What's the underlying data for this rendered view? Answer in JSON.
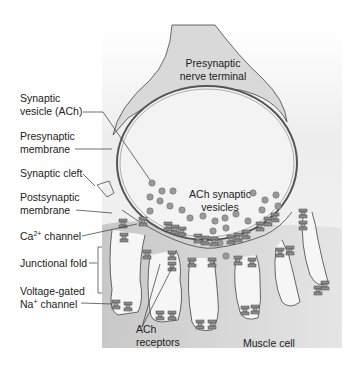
{
  "diagram": {
    "colors": {
      "background_panel": "#e6e6e6",
      "terminal_fill": "#d9d9d9",
      "cleft_fill": "#f2f2f2",
      "muscle_fill": "#bfbfbf",
      "vesicle_fill": "#9a9a9a",
      "channel_fill": "#8c8c8c",
      "outline": "#444444"
    },
    "inner_labels": {
      "presynaptic_terminal_line1": "Presynaptic",
      "presynaptic_terminal_line2": "nerve terminal",
      "ach_vesicles_line1": "ACh synaptic",
      "ach_vesicles_line2": "vesicles",
      "ach_receptors_line1": "ACh",
      "ach_receptors_line2": "receptors",
      "muscle_cell": "Muscle cell"
    },
    "left_labels": [
      {
        "id": "synaptic-vesicle",
        "line1": "Synaptic",
        "line2": "vesicle (ACh)"
      },
      {
        "id": "presynaptic-membrane",
        "line1": "Presynaptic",
        "line2": "membrane"
      },
      {
        "id": "synaptic-cleft",
        "line1": "Synaptic cleft",
        "line2": ""
      },
      {
        "id": "postsynaptic-membrane",
        "line1": "Postsynaptic",
        "line2": "membrane"
      },
      {
        "id": "ca-channel",
        "line1_pre": "Ca",
        "line1_sup": "2+",
        "line1_post": " channel"
      },
      {
        "id": "junctional-fold",
        "line1": "Junctional fold",
        "line2": ""
      },
      {
        "id": "na-channel",
        "line1": "Voltage-gated",
        "line2_pre": "Na",
        "line2_sup": "+",
        "line2_post": " channel"
      }
    ]
  }
}
